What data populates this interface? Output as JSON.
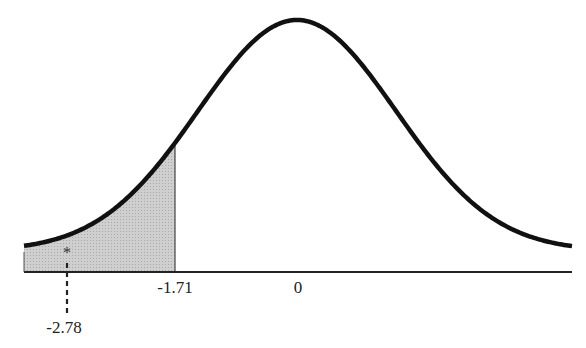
{
  "chart_data": {
    "type": "area",
    "title": "",
    "xlabel": "",
    "ylabel": "",
    "distribution": {
      "name": "normal",
      "mean": 0,
      "sd": 1
    },
    "shaded_region": {
      "from": "-inf",
      "to": -1.71,
      "fill": "#c8c8c8"
    },
    "tick_labels": [
      {
        "value": -1.71,
        "label": "-1.71"
      },
      {
        "value": 0,
        "label": "0"
      }
    ],
    "annotations": [
      {
        "value": -2.78,
        "label": "-2.78",
        "marker": "*",
        "style": "dashed-line"
      }
    ],
    "grid": false,
    "legend": null
  },
  "labels": {
    "critical": "-1.71",
    "zero": "0",
    "statistic": "-2.78",
    "marker": "*"
  },
  "colors": {
    "curve": "#111111",
    "shade": "#c8c8c8",
    "axis": "#222222"
  }
}
